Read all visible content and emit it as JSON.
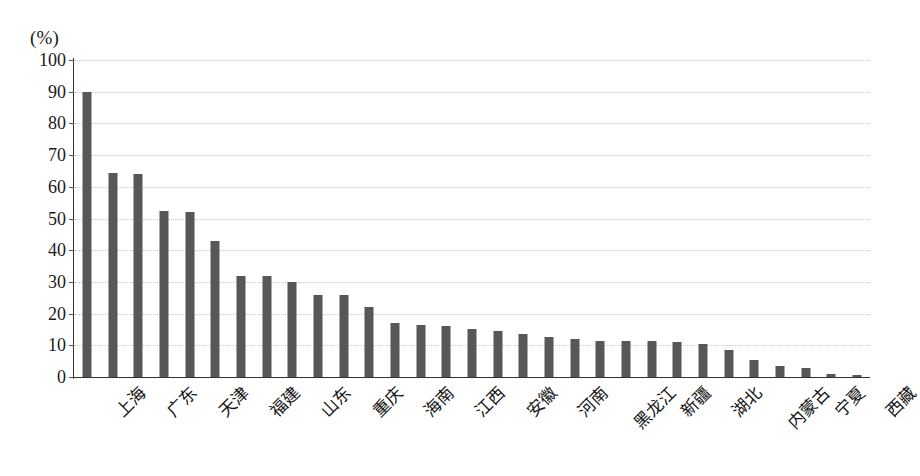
{
  "chart_data": {
    "type": "bar",
    "title": "",
    "subtitle": "",
    "xlabel": "",
    "ylabel": "",
    "unit_label": "(%)",
    "ylim": [
      0,
      100
    ],
    "ytick_step": 10,
    "yticks": [
      "100",
      "90",
      "80",
      "70",
      "60",
      "50",
      "40",
      "30",
      "20",
      "10",
      "0"
    ],
    "grid": true,
    "legend": false,
    "bar_color": "#575757",
    "label_rotation": -45,
    "labels_every_n": 2,
    "categories": [
      "上海",
      "北京",
      "广东",
      "浙江",
      "天津",
      "江苏",
      "福建",
      "辽宁",
      "山东",
      "陕西",
      "重庆",
      "湖南",
      "海南",
      "吉林",
      "江西",
      "四川",
      "安徽",
      "山西",
      "河南",
      "河北",
      "黑龙江",
      "广西",
      "新疆",
      "云南",
      "湖北",
      "甘肃",
      "内蒙古",
      "青海",
      "宁夏",
      "贵州",
      "西藏"
    ],
    "values": [
      90,
      64.5,
      64,
      52.5,
      52,
      43,
      32,
      32,
      30,
      26,
      26,
      22,
      17,
      16.5,
      16,
      15,
      14.5,
      13.5,
      12.5,
      12,
      11.5,
      11.5,
      11.5,
      11,
      10.5,
      8.5,
      5.5,
      3.5,
      3,
      0.8,
      0.6
    ],
    "visible_tick_labels": [
      "上海",
      "广东",
      "天津",
      "福建",
      "山东",
      "重庆",
      "海南",
      "江西",
      "安徽",
      "河南",
      "黑龙江",
      "新疆",
      "湖北",
      "内蒙古",
      "宁夏",
      "西藏"
    ]
  }
}
